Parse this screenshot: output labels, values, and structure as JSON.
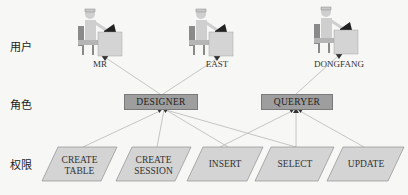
{
  "rows": {
    "users_label": "用户",
    "roles_label": "角色",
    "permissions_label": "权限"
  },
  "users": [
    {
      "name": "MR"
    },
    {
      "name": "EAST"
    },
    {
      "name": "DONGFANG"
    }
  ],
  "roles": [
    {
      "name": "DESIGNER"
    },
    {
      "name": "QUERYER"
    }
  ],
  "permissions": [
    {
      "line1": "CREATE",
      "line2": "TABLE"
    },
    {
      "line1": "CREATE",
      "line2": "SESSION"
    },
    {
      "line1": "INSERT",
      "line2": ""
    },
    {
      "line1": "SELECT",
      "line2": ""
    },
    {
      "line1": "UPDATE",
      "line2": ""
    }
  ],
  "relations": {
    "user_role": [
      [
        "MR",
        "DESIGNER"
      ],
      [
        "EAST",
        "DESIGNER"
      ],
      [
        "DONGFANG",
        "QUERYER"
      ]
    ],
    "role_permission": [
      [
        "DESIGNER",
        "CREATE TABLE"
      ],
      [
        "DESIGNER",
        "CREATE SESSION"
      ],
      [
        "DESIGNER",
        "INSERT"
      ],
      [
        "DESIGNER",
        "SELECT"
      ],
      [
        "QUERYER",
        "INSERT"
      ],
      [
        "QUERYER",
        "SELECT"
      ],
      [
        "QUERYER",
        "UPDATE"
      ]
    ]
  },
  "colors": {
    "role_fill": "#9e9e9e",
    "permission_fill": "#d4d4d4",
    "line": "#b0b0b0"
  }
}
